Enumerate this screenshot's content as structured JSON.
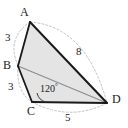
{
  "figure": {
    "kind": "quadrilateral-with-diagonal",
    "shape_name": "ABCD",
    "fill_color": "#e3e3e3",
    "stroke_color": "#1a1a1a",
    "diagonal_color": "#8c8c8c",
    "arc_color": "#b0b0b0",
    "vertices": [
      {
        "name": "A",
        "label": "A",
        "x": 30,
        "y": 22,
        "label_x": 20,
        "label_y": 6
      },
      {
        "name": "B",
        "label": "B",
        "x": 18,
        "y": 66,
        "label_x": 4,
        "label_y": 60
      },
      {
        "name": "C",
        "label": "C",
        "x": 32,
        "y": 102,
        "label_x": 27,
        "label_y": 106
      },
      {
        "name": "D",
        "label": "D",
        "x": 107,
        "y": 103,
        "label_x": 112,
        "label_y": 94
      }
    ],
    "sides": [
      {
        "name": "AB",
        "length_label": "3",
        "label_x": 5,
        "label_y": 33
      },
      {
        "name": "BC",
        "length_label": "3",
        "label_x": 8,
        "label_y": 82
      },
      {
        "name": "CD",
        "length_label": "5",
        "label_x": 65,
        "label_y": 113
      },
      {
        "name": "AD",
        "length_label": "8",
        "label_x": 76,
        "label_y": 47
      }
    ],
    "angles": [
      {
        "name": "angle-BCD",
        "at_vertex": "C",
        "value": "120",
        "degree_symbol": "°",
        "label_x": 40,
        "label_y": 84
      }
    ],
    "diagonal": {
      "name": "BD",
      "from": "B",
      "to": "D"
    }
  }
}
